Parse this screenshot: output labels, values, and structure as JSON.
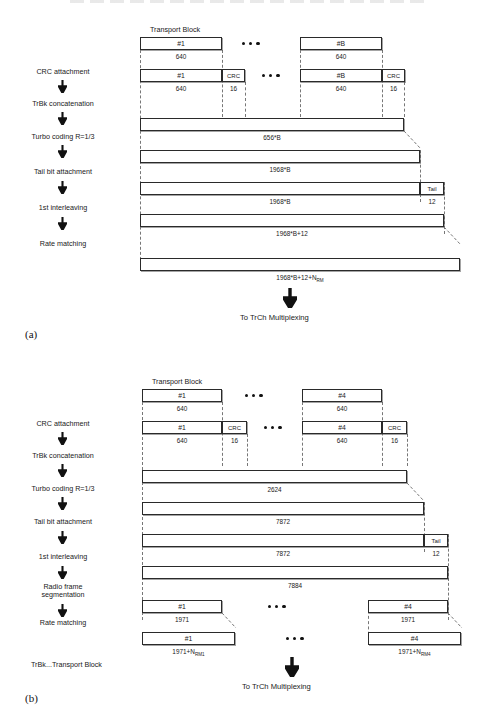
{
  "figure": {
    "top_cut_text": "",
    "legend_note": "TrBk...Transport Block"
  },
  "panel_a": {
    "caption": "(a)",
    "transport_block_title": "Transport Block",
    "stages": [
      {
        "label": "CRC attachment"
      },
      {
        "label": "TrBk concatenation"
      },
      {
        "label": "Turbo coding R=1/3"
      },
      {
        "label": "Tail bit attachment"
      },
      {
        "label": "1st interleaving"
      },
      {
        "label": "Rate matching"
      }
    ],
    "row_tb": {
      "first_label": "#1",
      "first_size": "640",
      "last_label": "#B",
      "last_size": "640"
    },
    "row_crc": {
      "first_label": "#1",
      "first_size": "640",
      "crc_label": "CRC",
      "crc_size": "16",
      "last_label": "#B",
      "last_size": "640",
      "last_crc_label": "CRC",
      "last_crc_size": "16"
    },
    "row_concat": {
      "size": "656*B"
    },
    "row_turbo": {
      "size": "1968*B"
    },
    "row_tail": {
      "size": "1968*B",
      "tail_label": "Tail",
      "tail_size": "12"
    },
    "row_interleave": {
      "size": "1968*B+12"
    },
    "row_ratematch": {
      "size_main": "1968*B+12+N",
      "size_sub": "RM"
    },
    "output_label": "To TrCh Multiplexing"
  },
  "panel_b": {
    "caption": "(b)",
    "transport_block_title": "Transport Block",
    "stages": [
      {
        "label": "CRC attachment"
      },
      {
        "label": "TrBk concatenation"
      },
      {
        "label": "Turbo coding R=1/3"
      },
      {
        "label": "Tail bit attachment"
      },
      {
        "label": "1st interleaving"
      },
      {
        "label": "Radio frame\nsegmentation"
      },
      {
        "label": "Rate matching"
      }
    ],
    "row_tb": {
      "first_label": "#1",
      "first_size": "640",
      "last_label": "#4",
      "last_size": "640"
    },
    "row_crc": {
      "first_label": "#1",
      "first_size": "640",
      "crc_label": "CRC",
      "crc_size": "16",
      "last_label": "#4",
      "last_size": "640",
      "last_crc_label": "CRC",
      "last_crc_size": "16"
    },
    "row_concat": {
      "size": "2624"
    },
    "row_turbo": {
      "size": "7872"
    },
    "row_tail": {
      "size": "7872",
      "tail_label": "Tail",
      "tail_size": "12"
    },
    "row_interleave": {
      "size": "7884"
    },
    "row_segment": {
      "first_label": "#1",
      "first_size": "1971",
      "last_label": "#4",
      "last_size": "1971"
    },
    "row_ratematch": {
      "first_label": "#1",
      "first_size_main": "1971+N",
      "first_size_sub": "RM1",
      "last_label": "#4",
      "last_size_main": "1971+N",
      "last_size_sub": "RM4"
    },
    "output_label": "To TrCh Multiplexing"
  }
}
